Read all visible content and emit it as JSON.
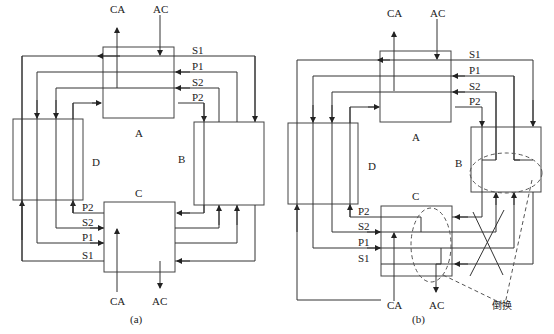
{
  "figure": {
    "panels": [
      {
        "id": "a",
        "caption": "(a)",
        "nodes": [
          "A",
          "B",
          "C",
          "D"
        ],
        "top_labels": {
          "out": "CA",
          "in": "AC"
        },
        "bottom_labels": {
          "in": "CA",
          "out": "AC"
        },
        "ring_labels_top": [
          "S1",
          "P1",
          "S2",
          "P2"
        ],
        "ring_labels_bottom": [
          "P2",
          "S2",
          "P1",
          "S1"
        ]
      },
      {
        "id": "b",
        "caption": "(b)",
        "nodes": [
          "A",
          "B",
          "C",
          "D"
        ],
        "top_labels": {
          "out": "CA",
          "in": "AC"
        },
        "bottom_labels": {
          "in": "CA",
          "out": "AC"
        },
        "ring_labels_top": [
          "S1",
          "P1",
          "S2",
          "P2"
        ],
        "ring_labels_bottom": [
          "P2",
          "S2",
          "P1",
          "S1"
        ],
        "annotation": "倒换"
      }
    ]
  },
  "labels": {
    "a": {
      "CA_top": "CA",
      "AC_top": "AC",
      "S1_top": "S1",
      "P1_top": "P1",
      "S2_top": "S2",
      "P2_top": "P2",
      "node_A": "A",
      "node_B": "B",
      "node_C": "C",
      "node_D": "D",
      "P2_bot": "P2",
      "S2_bot": "S2",
      "P1_bot": "P1",
      "S1_bot": "S1",
      "CA_bot": "CA",
      "AC_bot": "AC",
      "caption": "(a)"
    },
    "b": {
      "CA_top": "CA",
      "AC_top": "AC",
      "S1_top": "S1",
      "P1_top": "P1",
      "S2_top": "S2",
      "P2_top": "P2",
      "node_A": "A",
      "node_B": "B",
      "node_C": "C",
      "node_D": "D",
      "P2_bot": "P2",
      "S2_bot": "S2",
      "P1_bot": "P1",
      "S1_bot": "S1",
      "CA_bot": "CA",
      "AC_bot": "AC",
      "caption": "(b)",
      "switch": "倒换"
    }
  }
}
